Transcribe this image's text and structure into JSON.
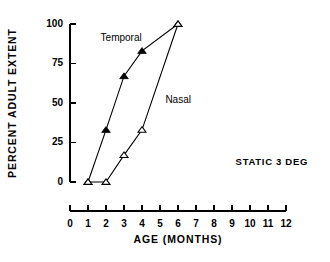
{
  "chart_data": {
    "type": "line",
    "title": "",
    "xlabel": "AGE (MONTHS)",
    "ylabel": "PERCENT ADULT EXTENT",
    "xlim": [
      0,
      12
    ],
    "ylim": [
      0,
      100
    ],
    "xticks": [
      "0",
      "1",
      "2",
      "3",
      "4",
      "5",
      "6",
      "7",
      "8",
      "9",
      "10",
      "11",
      "12"
    ],
    "yticks": [
      "0",
      "25",
      "50",
      "75",
      "100"
    ],
    "grid": false,
    "legend": "inline-labels",
    "annotations": [
      {
        "text": "STATIC 3 DEG",
        "x": 9.2,
        "y": 11
      }
    ],
    "series": [
      {
        "name": "Temporal",
        "marker": "filled-triangle",
        "label_x": 1.7,
        "label_y": 89,
        "x": [
          1,
          2,
          3,
          4,
          6
        ],
        "values": [
          0,
          33,
          67,
          83,
          100
        ]
      },
      {
        "name": "Nasal",
        "marker": "open-triangle",
        "label_x": 5.3,
        "label_y": 50,
        "x": [
          1,
          2,
          3,
          4,
          6
        ],
        "values": [
          0,
          0,
          17,
          33,
          100
        ]
      }
    ]
  },
  "axis": {
    "x_title": "AGE (MONTHS)",
    "y_title": "PERCENT ADULT EXTENT"
  },
  "colors": {
    "ink": "#000000",
    "background": "#ffffff"
  }
}
